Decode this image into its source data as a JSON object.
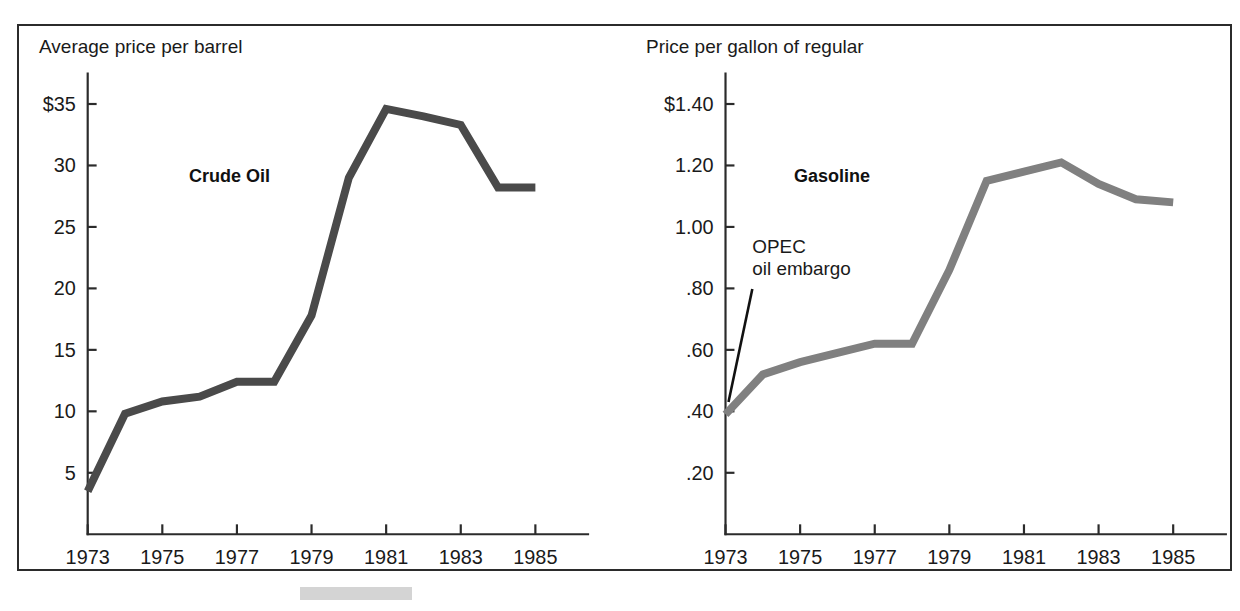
{
  "figure": {
    "background_color": "#ffffff",
    "frame_color": "#2b2b2b",
    "scan_artifact_color": "#d4d4d4"
  },
  "chart_data": [
    {
      "type": "line",
      "id": "crude-oil",
      "title": "Crude Oil",
      "ylabel": "Average price per barrel",
      "xlabel": "",
      "series_name": "Crude Oil",
      "series_color": "#4a4a4a",
      "x": [
        1973,
        1974,
        1975,
        1976,
        1977,
        1978,
        1979,
        1980,
        1981,
        1982,
        1983,
        1984,
        1985
      ],
      "values": [
        3.5,
        9.8,
        10.8,
        11.2,
        12.4,
        12.4,
        17.8,
        29.0,
        34.6,
        34.0,
        33.3,
        28.2,
        28.2
      ],
      "xlim": [
        1973,
        1985.4
      ],
      "ylim": [
        0,
        36.5
      ],
      "ytick_values": [
        35,
        30,
        25,
        20,
        15,
        10,
        5
      ],
      "ytick_labels": [
        "$35",
        "30",
        "25",
        "20",
        "15",
        "10",
        "5"
      ],
      "xtick_values": [
        1973,
        1975,
        1977,
        1979,
        1981,
        1983,
        1985
      ],
      "xtick_labels": [
        "1973",
        "1975",
        "1977",
        "1979",
        "1981",
        "1983",
        "1985"
      ],
      "grid": false,
      "legend": "none",
      "annotations": []
    },
    {
      "type": "line",
      "id": "gasoline",
      "title": "Gasoline",
      "ylabel": "Price per gallon of regular",
      "xlabel": "",
      "series_name": "Gasoline",
      "series_color": "#808080",
      "x": [
        1973,
        1974,
        1975,
        1976,
        1977,
        1978,
        1979,
        1980,
        1981,
        1982,
        1983,
        1984,
        1985
      ],
      "values": [
        0.39,
        0.52,
        0.56,
        0.59,
        0.62,
        0.62,
        0.86,
        1.15,
        1.18,
        1.21,
        1.14,
        1.09,
        1.08
      ],
      "xlim": [
        1973,
        1985.4
      ],
      "ylim": [
        0,
        1.46
      ],
      "ytick_values": [
        1.4,
        1.2,
        1.0,
        0.8,
        0.6,
        0.4,
        0.2
      ],
      "ytick_labels": [
        "$1.40",
        "1.20",
        "1.00",
        ".80",
        ".60",
        ".40",
        ".20"
      ],
      "xtick_values": [
        1973,
        1975,
        1977,
        1979,
        1981,
        1983,
        1985
      ],
      "xtick_labels": [
        "1973",
        "1975",
        "1977",
        "1979",
        "1981",
        "1983",
        "1985"
      ],
      "grid": false,
      "legend": "none",
      "annotations": [
        {
          "id": "opec-embargo",
          "line_1": "OPEC",
          "line_2": "oil embargo",
          "points_to_x": 1973,
          "points_to_y": 0.43
        }
      ]
    }
  ],
  "panels": {
    "crude": {
      "axis_title": "Average price per barrel",
      "series_label": "Crude Oil"
    },
    "gasoline": {
      "axis_title": "Price per gallon of regular",
      "series_label": "Gasoline",
      "annotation_line_1": "OPEC",
      "annotation_line_2": "oil embargo"
    }
  }
}
